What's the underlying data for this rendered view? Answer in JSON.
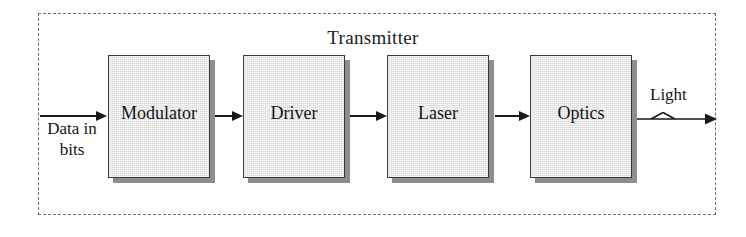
{
  "figure": {
    "type": "block-diagram",
    "enclosure": {
      "title": "Transmitter",
      "border_style": "dashed",
      "border_color": "#6d6d6d"
    },
    "blocks": [
      {
        "label": "Modulator",
        "order": 1
      },
      {
        "label": "Driver",
        "order": 2
      },
      {
        "label": "Laser",
        "order": 3
      },
      {
        "label": "Optics",
        "order": 4
      }
    ],
    "input": {
      "label_line1": "Data in",
      "label_line2": "bits",
      "arrow_name": "input-arrow"
    },
    "output": {
      "label": "Light",
      "arrow_name": "light-output-arrow",
      "symbol": "zigzag-ray"
    },
    "connectors": [
      {
        "from": "Modulator",
        "to": "Driver"
      },
      {
        "from": "Driver",
        "to": "Laser"
      },
      {
        "from": "Laser",
        "to": "Optics"
      }
    ],
    "colors": {
      "block_fill": "#e4e4e4",
      "block_stroke": "#3a3a3a",
      "block_shadow": "#8e8e8e",
      "line": "#1a1a1a",
      "text": "#141414",
      "background": "#ffffff"
    }
  }
}
